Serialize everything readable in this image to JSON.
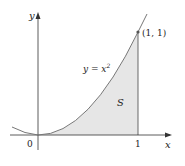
{
  "diagram": {
    "axes": {
      "x_label": "x",
      "y_label": "y",
      "origin_label": "0",
      "x_tick_label": "1"
    },
    "curve": {
      "equation_label_prefix": "y = x",
      "equation_exponent": "2"
    },
    "point": {
      "label": "(1, 1)"
    },
    "region": {
      "label": "S",
      "fill": "#e6e6e6"
    },
    "colors": {
      "axis": "#333333",
      "curve": "#777777",
      "region": "#e6e6e6"
    }
  }
}
